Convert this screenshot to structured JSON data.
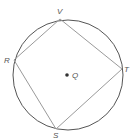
{
  "diagram": {
    "type": "inscribed-quadrilateral",
    "circle": {
      "center": [
        68,
        75
      ],
      "radius": 55,
      "stroke": "#555555"
    },
    "quadrilateral": {
      "stroke": "#9a9a9a",
      "order": [
        "V",
        "T",
        "S",
        "R"
      ]
    },
    "points": {
      "V": {
        "label": "V",
        "x": 60,
        "y": 19
      },
      "T": {
        "label": "T",
        "x": 122,
        "y": 69
      },
      "S": {
        "label": "S",
        "x": 56,
        "y": 129
      },
      "R": {
        "label": "R",
        "x": 14,
        "y": 60
      }
    },
    "center_point": {
      "label": "Q",
      "x": 67,
      "y": 75
    }
  }
}
